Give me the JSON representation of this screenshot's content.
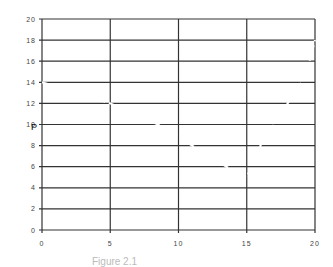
{
  "chart_data": {
    "type": "line",
    "title": "",
    "xlabel": "",
    "ylabel": "P",
    "xlim": [
      0,
      20
    ],
    "ylim": [
      0,
      20
    ],
    "x_ticks": [
      0,
      5,
      10,
      15,
      20
    ],
    "y_ticks": [
      0,
      2,
      4,
      6,
      8,
      10,
      12,
      14,
      16,
      18,
      20
    ],
    "x_tick_labels": [
      "0",
      "5",
      "10",
      "15",
      "20"
    ],
    "y_tick_labels": [
      "0",
      "2",
      "4",
      "6",
      "8",
      "10",
      "12",
      "14",
      "16",
      "18",
      "20"
    ],
    "grid": true,
    "legend": null,
    "series": [
      {
        "name": "P",
        "color": "#ffffff",
        "x": [
          0,
          5,
          8.5,
          11,
          13.5,
          15,
          16,
          17,
          18,
          19,
          19.6,
          20
        ],
        "values": [
          14,
          12,
          10,
          8,
          6,
          5,
          8,
          10,
          12,
          14,
          16,
          18
        ]
      }
    ],
    "caption": "Figure 2.1"
  },
  "colors": {
    "grid": "#333333",
    "background": "#ffffff",
    "curve": "#ffffff"
  },
  "plot_box": {
    "left": 42,
    "right": 315,
    "top": 19,
    "bottom": 230
  }
}
